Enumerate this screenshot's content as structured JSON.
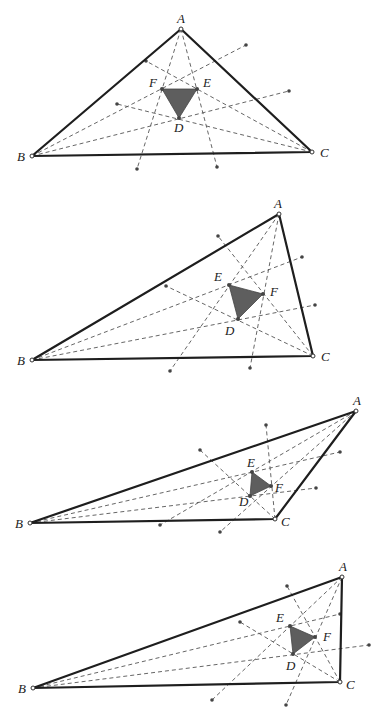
{
  "figure": {
    "colors": {
      "sides": "#1e1e1e",
      "trisectors": "#555555",
      "morley_fill": "#5e5e5e"
    },
    "panels": [
      {
        "vertices": {
          "A": [
            181,
            29
          ],
          "B": [
            32,
            156
          ],
          "C": [
            312,
            152
          ]
        },
        "morley": {
          "D": [
            179,
            118
          ],
          "E": [
            197,
            89
          ],
          "F": [
            162,
            89
          ]
        },
        "labels": {
          "A": "A",
          "B": "B",
          "C": "C",
          "D": "D",
          "E": "E",
          "F": "F"
        },
        "trisectors": [
          [
            [
              181,
              29
            ],
            [
              137,
              169
            ]
          ],
          [
            [
              181,
              29
            ],
            [
              217,
              167
            ]
          ],
          [
            [
              32,
              156
            ],
            [
              246,
              45
            ]
          ],
          [
            [
              32,
              156
            ],
            [
              289,
              91
            ]
          ],
          [
            [
              312,
              152
            ],
            [
              146,
              61
            ]
          ],
          [
            [
              312,
              152
            ],
            [
              117,
              104
            ]
          ]
        ]
      },
      {
        "vertices": {
          "A": [
            279,
            214
          ],
          "B": [
            32,
            360
          ],
          "C": [
            313,
            356
          ]
        },
        "morley": {
          "D": [
            238,
            319
          ],
          "E": [
            229,
            285
          ],
          "F": [
            263,
            294
          ]
        },
        "labels": {
          "A": "A",
          "B": "B",
          "C": "C",
          "D": "D",
          "E": "E",
          "F": "F"
        },
        "trisectors": [
          [
            [
              279,
              214
            ],
            [
              170,
              371
            ]
          ],
          [
            [
              279,
              214
            ],
            [
              250,
              368
            ]
          ],
          [
            [
              32,
              360
            ],
            [
              302,
              257
            ]
          ],
          [
            [
              32,
              360
            ],
            [
              315,
              305
            ]
          ],
          [
            [
              313,
              356
            ],
            [
              218,
              236
            ]
          ],
          [
            [
              313,
              356
            ],
            [
              166,
              286
            ]
          ]
        ]
      },
      {
        "vertices": {
          "A": [
            356,
            411
          ],
          "B": [
            30,
            523
          ],
          "C": [
            275,
            519
          ]
        },
        "morley": {
          "D": [
            250,
            496
          ],
          "E": [
            252,
            472
          ],
          "F": [
            271,
            486
          ]
        },
        "labels": {
          "A": "A",
          "B": "B",
          "C": "C",
          "D": "D",
          "E": "E",
          "F": "F"
        },
        "trisectors": [
          [
            [
              356,
              411
            ],
            [
              220,
              532
            ]
          ],
          [
            [
              356,
              411
            ],
            [
              160,
              525
            ]
          ],
          [
            [
              30,
              523
            ],
            [
              340,
              452
            ]
          ],
          [
            [
              30,
              523
            ],
            [
              316,
              488
            ]
          ],
          [
            [
              275,
              519
            ],
            [
              266,
              425
            ]
          ],
          [
            [
              275,
              519
            ],
            [
              200,
              450
            ]
          ]
        ]
      },
      {
        "vertices": {
          "A": [
            342,
            577
          ],
          "B": [
            33,
            688
          ],
          "C": [
            340,
            682
          ]
        },
        "morley": {
          "D": [
            293,
            654
          ],
          "E": [
            290,
            626
          ],
          "F": [
            315,
            637
          ]
        },
        "labels": {
          "A": "A",
          "B": "B",
          "C": "C",
          "D": "D",
          "E": "E",
          "F": "F"
        },
        "trisectors": [
          [
            [
              342,
              577
            ],
            [
              212,
              700
            ]
          ],
          [
            [
              342,
              577
            ],
            [
              286,
              705
            ]
          ],
          [
            [
              33,
              688
            ],
            [
              340,
              614
            ]
          ],
          [
            [
              33,
              688
            ],
            [
              369,
              645
            ]
          ],
          [
            [
              340,
              682
            ],
            [
              287,
              586
            ]
          ],
          [
            [
              340,
              682
            ],
            [
              240,
              622
            ]
          ]
        ]
      }
    ]
  }
}
